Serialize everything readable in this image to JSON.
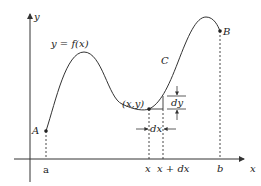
{
  "diagram": {
    "axes": {
      "x_label": "x",
      "y_label": "y"
    },
    "curve": {
      "equation_label": "y = f(x)",
      "name_label": "C"
    },
    "points": {
      "start": {
        "label": "A"
      },
      "end": {
        "label": "B"
      },
      "moving": {
        "label": "(x,y)"
      }
    },
    "x_ticks": {
      "a": "a",
      "x": "x",
      "x_plus_dx": "x + dx",
      "b": "b"
    },
    "differentials": {
      "dx": "dx",
      "dy": "dy"
    },
    "colors": {
      "stroke": "#333333",
      "text": "#222222"
    }
  }
}
